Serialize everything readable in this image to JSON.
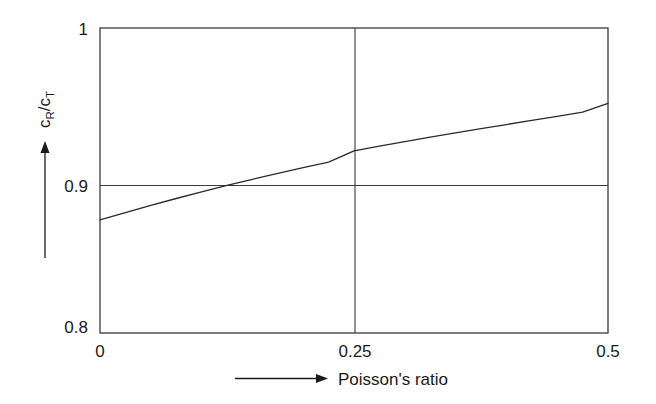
{
  "figure": {
    "background_color": "#ffffff",
    "line_color": "#2a2a2a"
  },
  "axes": {
    "y_axis_title_main": "c",
    "y_axis_title_sub1": "R",
    "y_axis_title_slash": "/c",
    "y_axis_title_sub2": "T",
    "y_axis_title_plain": "cR/cT",
    "x_axis_title": "Poisson's ratio",
    "y_ticks": [
      "0.8",
      "0.9",
      "1"
    ],
    "x_ticks": [
      "0",
      "0.25",
      "0.5"
    ],
    "x_arrow_icon": "right-arrow-icon",
    "y_arrow_icon": "up-arrow-icon"
  },
  "chart_data": {
    "type": "line",
    "title": "",
    "xlabel": "Poisson's ratio",
    "ylabel": "cR/cT",
    "xlim": [
      0,
      0.5
    ],
    "ylim": [
      0.8,
      1.0
    ],
    "xticks": [
      0,
      0.25,
      0.5
    ],
    "xticklabels": [
      "0",
      "0.25",
      "0.5"
    ],
    "yticks": [
      0.8,
      0.9,
      1.0
    ],
    "yticklabels": [
      "0.8",
      "0.9",
      "1"
    ],
    "grid": true,
    "gridlines": {
      "horizontal": [
        0.9
      ],
      "vertical": [
        0.25
      ]
    },
    "legend": null,
    "series": [
      {
        "name": "Rayleigh to shear wave speed ratio",
        "x": [
          0.0,
          0.025,
          0.05,
          0.075,
          0.1,
          0.125,
          0.15,
          0.175,
          0.2,
          0.225,
          0.25,
          0.275,
          0.3,
          0.325,
          0.35,
          0.375,
          0.4,
          0.425,
          0.45,
          0.475,
          0.5
        ],
        "y": [
          0.8742,
          0.879,
          0.8837,
          0.8882,
          0.8926,
          0.8968,
          0.9008,
          0.9047,
          0.9084,
          0.912,
          0.9194,
          0.9225,
          0.9255,
          0.9284,
          0.9312,
          0.934,
          0.9367,
          0.9394,
          0.9421,
          0.9449,
          0.9505
        ]
      }
    ],
    "annotations": [
      {
        "text": "curve crosses 0.9 at Poisson's ratio ~0.145"
      }
    ]
  }
}
